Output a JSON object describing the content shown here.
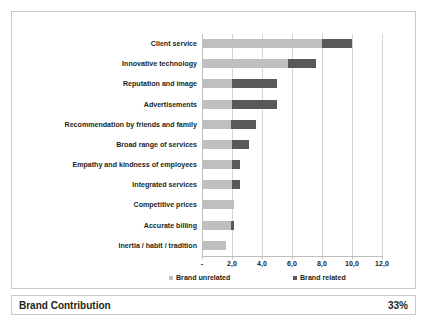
{
  "chart_data": {
    "type": "bar",
    "orientation": "horizontal",
    "stacked": true,
    "title": "",
    "subtitle": "",
    "xlabel": "",
    "ylabel": "",
    "xlim": [
      0,
      12
    ],
    "grid": true,
    "legend_position": "bottom",
    "categories": [
      "Client service",
      "Innovative technology",
      "Reputation and image",
      "Advertisements",
      "Recommendation by friends and family",
      "Broad range of services",
      "Empathy and kindness of employees",
      "Integrated services",
      "Competitive prices",
      "Accurate billing",
      "Inertia / habit / tradition"
    ],
    "series": [
      {
        "name": "Brand unrelated",
        "color": "#bfbfbf",
        "values": [
          8.0,
          5.7,
          2.0,
          2.0,
          1.9,
          2.0,
          2.0,
          2.0,
          2.1,
          1.9,
          1.6
        ]
      },
      {
        "name": "Brand related",
        "color": "#595959",
        "values": [
          2.0,
          1.9,
          3.0,
          3.0,
          1.7,
          1.1,
          0.5,
          0.5,
          0.0,
          0.2,
          0.0
        ]
      }
    ],
    "totals": [
      10.0,
      7.6,
      5.0,
      5.0,
      3.6,
      3.1,
      2.5,
      2.5,
      2.1,
      2.1,
      1.6
    ],
    "xticks": [
      {
        "value": 0,
        "label": "-"
      },
      {
        "value": 2,
        "label": "2,0"
      },
      {
        "value": 4,
        "label": "4,0"
      },
      {
        "value": 6,
        "label": "6,0"
      },
      {
        "value": 8,
        "label": "8,0"
      },
      {
        "value": 10,
        "label": "10,0"
      },
      {
        "value": 12,
        "label": "12,0"
      }
    ]
  },
  "legend": {
    "items": [
      {
        "label": "Brand unrelated",
        "color": "#bfbfbf"
      },
      {
        "label": "Brand related",
        "color": "#595959"
      }
    ]
  },
  "summary": {
    "title": "Brand Contribution",
    "value": "33%"
  }
}
